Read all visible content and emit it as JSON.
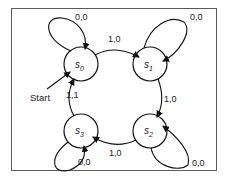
{
  "diagram": {
    "type": "state-machine",
    "start_label": "Start",
    "states": [
      {
        "id": "s0",
        "name": "s",
        "sub": "0",
        "cx": 81,
        "cy": 64
      },
      {
        "id": "s1",
        "name": "s",
        "sub": "1",
        "cx": 150,
        "cy": 64
      },
      {
        "id": "s2",
        "name": "s",
        "sub": "2",
        "cx": 150,
        "cy": 131
      },
      {
        "id": "s3",
        "name": "s",
        "sub": "3",
        "cx": 81,
        "cy": 131
      }
    ],
    "transitions": [
      {
        "from": "s0",
        "to": "s0",
        "label": "0,0"
      },
      {
        "from": "s0",
        "to": "s1",
        "label": "1,0"
      },
      {
        "from": "s1",
        "to": "s1",
        "label": "0,0"
      },
      {
        "from": "s1",
        "to": "s2",
        "label": "1,0"
      },
      {
        "from": "s2",
        "to": "s2",
        "label": "0,0"
      },
      {
        "from": "s2",
        "to": "s3",
        "label": "1,0"
      },
      {
        "from": "s3",
        "to": "s3",
        "label": "0,0"
      },
      {
        "from": "s3",
        "to": "s0",
        "label": "1,1"
      }
    ],
    "labels": {
      "loop_s0": "0,0",
      "edge_s0_s1": "1,0",
      "loop_s1": "0,0",
      "edge_s1_s2": "1,0",
      "loop_s2": "0,0",
      "edge_s2_s3": "1,0",
      "loop_s3": "0,0",
      "edge_s3_s0": "1,1",
      "start": "Start",
      "s0_name": "s",
      "s0_sub": "0",
      "s1_name": "s",
      "s1_sub": "1",
      "s2_name": "s",
      "s2_sub": "2",
      "s3_name": "s",
      "s3_sub": "3"
    },
    "colors": {
      "stroke": "#111111",
      "frame": "#5a5a5a",
      "background": "#ffffff"
    }
  }
}
